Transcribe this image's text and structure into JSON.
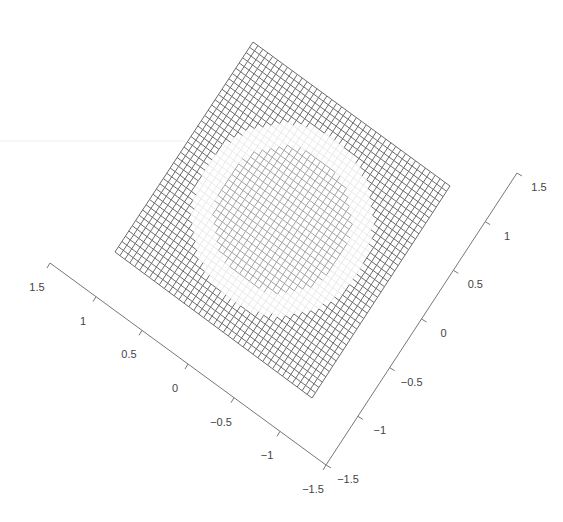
{
  "chart_data": {
    "type": "surface",
    "title": "",
    "xlabel": "",
    "ylabel": "",
    "zlabel": "",
    "x_axis": {
      "range": [
        -1.5,
        1.5
      ],
      "ticks": [
        1.5,
        1,
        0.5,
        0,
        -0.5,
        -1,
        -1.5
      ],
      "tick_labels": [
        "1.5",
        "1",
        "0.5",
        "0",
        "−0.5",
        "−1",
        "−1.5"
      ]
    },
    "y_axis": {
      "range": [
        -1.5,
        1.5
      ],
      "ticks": [
        -1.5,
        -1,
        -0.5,
        0,
        0.5,
        1,
        1.5
      ],
      "tick_labels": [
        "−1.5",
        "−1",
        "−0.5",
        "0",
        "0.5",
        "1",
        "1.5"
      ]
    },
    "grid_resolution": 40,
    "mesh_color": "#555555",
    "highlight_color": "#e8e8e8",
    "ring_radius": 1.0,
    "grid": true,
    "legend": null
  },
  "axes": {
    "left": {
      "start": [
        50,
        263
      ],
      "end": [
        326,
        465
      ],
      "labels": [
        "1.5",
        "1",
        "0.5",
        "0",
        "−0.5",
        "−1",
        "−1.5"
      ]
    },
    "right": {
      "start": [
        326,
        465
      ],
      "end": [
        517,
        173
      ],
      "labels": [
        "−1.5",
        "−1",
        "−0.5",
        "0",
        "0.5",
        "1",
        "1.5"
      ]
    }
  },
  "mesh": {
    "corners": {
      "top": [
        253,
        42
      ],
      "right": [
        450,
        186
      ],
      "bottom": [
        312,
        398
      ],
      "left": [
        115,
        252
      ]
    },
    "divisions": 40
  }
}
